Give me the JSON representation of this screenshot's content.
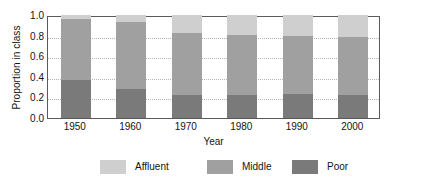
{
  "chart_data": {
    "type": "bar",
    "subtype": "stacked-bar-proportional",
    "title": "",
    "xlabel": "Year",
    "ylabel": "Proportion in class",
    "categories": [
      "1950",
      "1960",
      "1970",
      "1980",
      "1990",
      "2000"
    ],
    "ylim": [
      0.0,
      1.0
    ],
    "yticks": [
      "1.0",
      "0.8",
      "0.6",
      "0.4",
      "0.2",
      "0.0"
    ],
    "ytick_values": [
      1.0,
      0.8,
      0.6,
      0.4,
      0.2,
      0.0
    ],
    "grid": "horizontal-dotted",
    "legend_position": "bottom",
    "stack_order_bottom_to_top": [
      "Poor",
      "Middle",
      "Affluent"
    ],
    "series": [
      {
        "name": "Poor",
        "color": "#7a7a7a",
        "values": [
          0.37,
          0.285,
          0.22,
          0.22,
          0.23,
          0.22
        ]
      },
      {
        "name": "Middle",
        "color": "#a0a0a0",
        "values": [
          0.59,
          0.645,
          0.61,
          0.59,
          0.57,
          0.57
        ]
      },
      {
        "name": "Affluent",
        "color": "#cfcfcf",
        "values": [
          0.04,
          0.07,
          0.17,
          0.19,
          0.2,
          0.21
        ]
      }
    ],
    "cumulative_tops": {
      "poor": [
        0.37,
        0.285,
        0.22,
        0.22,
        0.23,
        0.22
      ],
      "middle": [
        0.96,
        0.93,
        0.83,
        0.81,
        0.8,
        0.79
      ],
      "affluent": [
        1.0,
        1.0,
        1.0,
        1.0,
        1.0,
        1.0
      ]
    }
  },
  "legend": {
    "items": [
      {
        "label": "Affluent",
        "color": "#cfcfcf"
      },
      {
        "label": "Middle",
        "color": "#a0a0a0"
      },
      {
        "label": "Poor",
        "color": "#7a7a7a"
      }
    ]
  },
  "colors": {
    "affluent": "#cfcfcf",
    "middle": "#a0a0a0",
    "poor": "#7a7a7a",
    "axis": "#5a5a5a",
    "grid": "#b4b4c8",
    "text": "#141414",
    "background": "#ffffff"
  }
}
